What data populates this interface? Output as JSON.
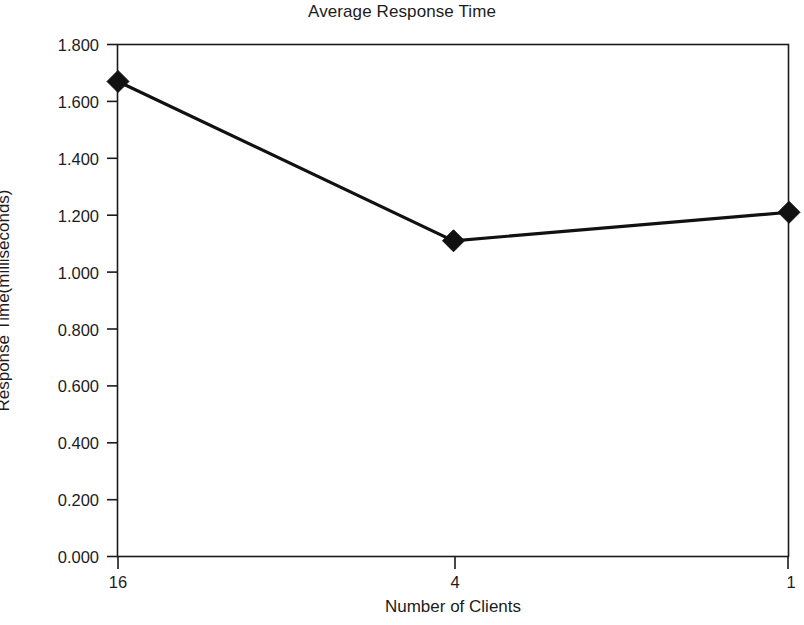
{
  "chart_data": {
    "type": "line",
    "title": "Average Response Time",
    "xlabel": "Number of Clients",
    "ylabel": "Response Time(milliseconds)",
    "categories": [
      "16",
      "4",
      "1"
    ],
    "values": [
      1.67,
      1.11,
      1.21
    ],
    "series": [
      {
        "name": "Average Response Time",
        "values": [
          1.67,
          1.11,
          1.21
        ],
        "color": "#111111",
        "marker": "diamond"
      }
    ],
    "ylim": [
      0.0,
      1.8
    ],
    "ytick_labels": [
      "1.800",
      "1.600",
      "1.400",
      "1.200",
      "1.000",
      "0.800",
      "0.600",
      "0.400",
      "0.200",
      "0.000"
    ],
    "ytick_values": [
      1.8,
      1.6,
      1.4,
      1.2,
      1.0,
      0.8,
      0.6,
      0.4,
      0.2,
      0.0
    ],
    "xtick_labels": [
      "16",
      "4",
      "1"
    ],
    "grid": false,
    "legend": false,
    "legend_position": "none",
    "frame": "box",
    "background_color": "#ffffff",
    "line_color": "#111111",
    "axis_color": "#1a1a1a"
  }
}
